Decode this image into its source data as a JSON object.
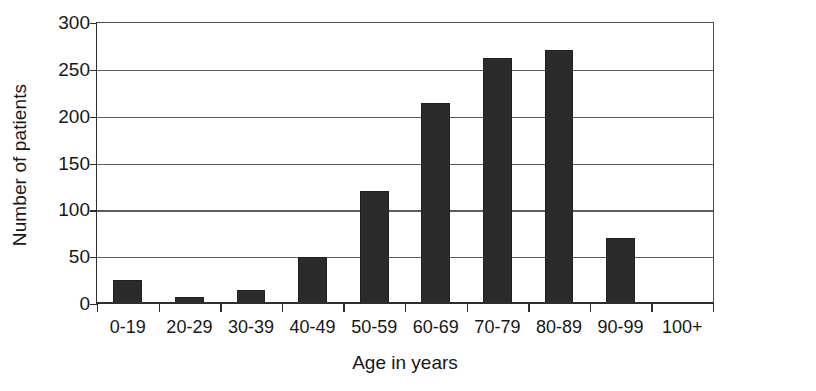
{
  "chart_data": {
    "type": "bar",
    "title": "",
    "xlabel": "Age in years",
    "ylabel": "Number of patients",
    "categories": [
      "0-19",
      "20-29",
      "30-39",
      "40-49",
      "50-59",
      "60-69",
      "70-79",
      "80-89",
      "90-99",
      "100+"
    ],
    "values": [
      26,
      8,
      15,
      50,
      121,
      215,
      263,
      271,
      70,
      2
    ],
    "ylim": [
      0,
      300
    ],
    "yticks": [
      0,
      50,
      100,
      150,
      200,
      250,
      300
    ],
    "ytick_labels": [
      "0",
      "50",
      "100",
      "150",
      "200",
      "250",
      "300"
    ],
    "grid": true,
    "grid_axis": "y",
    "legend": false,
    "legend_position": "none",
    "bar_color": "#2b2b2b",
    "grid_color": "#5d5d5d",
    "axis_color": "#2e2e2e",
    "background_color": "#ffffff"
  }
}
